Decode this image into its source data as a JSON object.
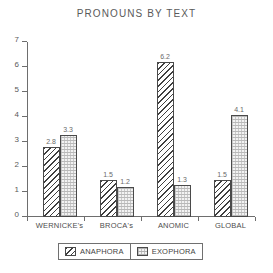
{
  "chart_data": {
    "type": "bar",
    "title": "PRONOUNS BY TEXT",
    "xlabel": "",
    "ylabel": "",
    "ylim": [
      0,
      7
    ],
    "yticks": [
      "0",
      "1",
      "2",
      "3",
      "4",
      "5",
      "6",
      "7"
    ],
    "grid": false,
    "legend_position": "bottom-center",
    "categories": [
      "WERNICKE's",
      "BROCA's",
      "ANOMIC",
      "GLOBAL"
    ],
    "series": [
      {
        "name": "ANAPHORA",
        "pattern": "diagonal-hatch",
        "values": [
          2.8,
          1.5,
          6.2,
          1.5
        ],
        "labels": [
          "2.8",
          "1.5",
          "6.2",
          "1.5"
        ]
      },
      {
        "name": "EXOPHORA",
        "pattern": "stipple",
        "values": [
          3.3,
          1.2,
          1.3,
          4.1
        ],
        "labels": [
          "3.3",
          "1.2",
          "1.3",
          "4.1"
        ]
      }
    ]
  },
  "legend": {
    "entries": [
      {
        "label": "ANAPHORA"
      },
      {
        "label": "EXOPHORA"
      }
    ]
  },
  "colors": {
    "axis": "#6e6e6e",
    "text": "#4d4d4d",
    "bar_outline": "#4a4a4a",
    "background": "#ffffff"
  }
}
